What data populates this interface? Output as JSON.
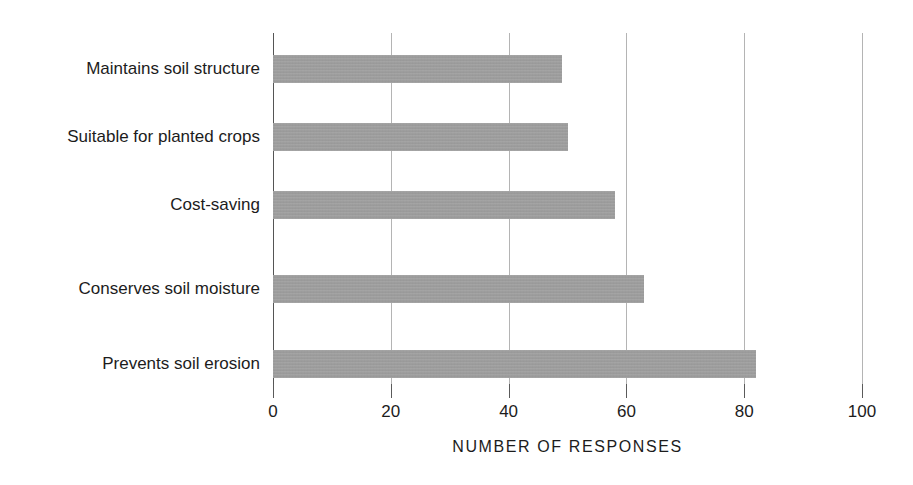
{
  "chart_data": {
    "type": "bar",
    "orientation": "horizontal",
    "title": "",
    "subtitle": "",
    "xlabel": "NUMBER OF RESPONSES",
    "ylabel": "",
    "categories": [
      "Maintains soil structure",
      "Suitable for planted crops",
      "Cost-saving",
      "Conserves soil moisture",
      "Prevents soil erosion"
    ],
    "values": [
      49,
      50,
      58,
      63,
      82
    ],
    "xlim": [
      0,
      100
    ],
    "xticks": [
      0,
      20,
      40,
      60,
      80,
      100
    ],
    "xtick_labels": [
      "0",
      "20",
      "40",
      "60",
      "80",
      "100"
    ],
    "grid": "vertical",
    "legend": "none",
    "bar_color": "#9e9e9e",
    "gridline_color": "#b4b4b4",
    "axis_color": "#555555",
    "text_color": "#1c1c1c",
    "background": "#ffffff"
  }
}
